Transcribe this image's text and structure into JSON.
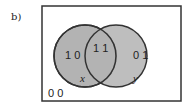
{
  "figure_label": "b)",
  "venn": {
    "universe_label": "0 0",
    "left_only_label": "1 0",
    "intersection_label": "1 1",
    "right_only_label": "0 1",
    "left_set_name": "x",
    "right_set_name": "y",
    "fill_color": "#b0b0b0",
    "stroke_color": "#333333"
  }
}
